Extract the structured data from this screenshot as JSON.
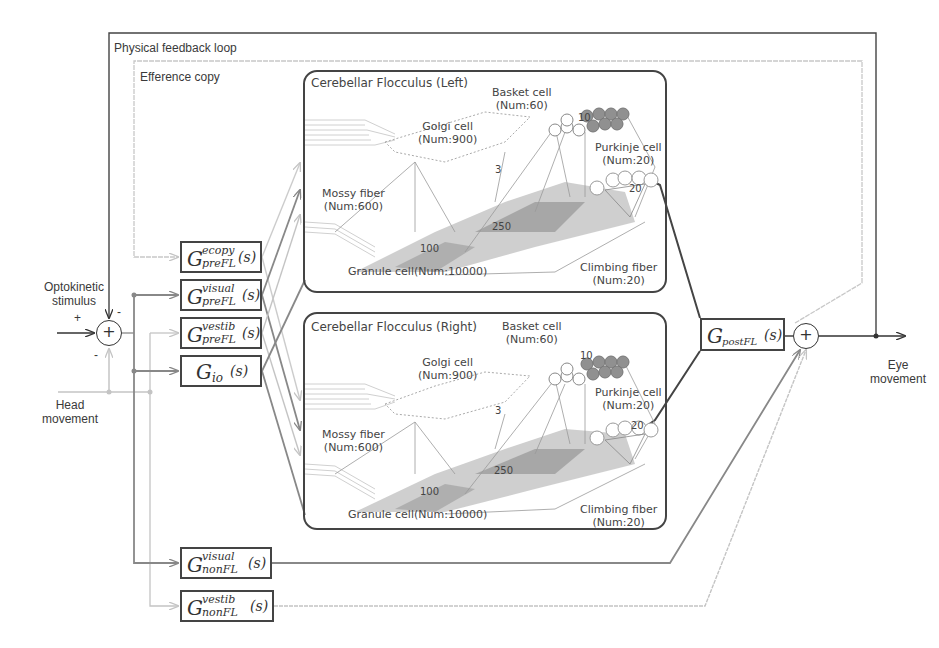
{
  "diagram": {
    "loops": {
      "physical_feedback": "Physical feedback loop",
      "efference_copy": "Efference copy"
    },
    "inputs": {
      "optokinetic": "Optokinetic\nstimulus",
      "optokinetic_line1": "Optokinetic",
      "optokinetic_line2": "stimulus",
      "head_line1": "Head",
      "head_line2": "movement"
    },
    "output": {
      "eye_line1": "Eye",
      "eye_line2": "movement"
    },
    "signs": {
      "plus_in": "+",
      "minus_top": "-",
      "minus_bottom": "-",
      "sum_symbol": "+"
    },
    "blocks": {
      "pre_ecopy": {
        "G": "G",
        "sup": "ecopy",
        "sub": "preFL",
        "arg": "(s)"
      },
      "pre_visual": {
        "G": "G",
        "sup": "visual",
        "sub": "preFL",
        "arg": "(s)"
      },
      "pre_vestib": {
        "G": "G",
        "sup": "vestib",
        "sub": "preFL",
        "arg": "(s)"
      },
      "io": {
        "G": "G",
        "sub": "io",
        "arg": "(s)"
      },
      "post": {
        "G": "G",
        "sub": "postFL",
        "arg": "(s)"
      },
      "non_visual": {
        "G": "G",
        "sup": "visual",
        "sub": "nonFL",
        "arg": "(s)"
      },
      "non_vestib": {
        "G": "G",
        "sup": "vestib",
        "sub": "nonFL",
        "arg": "(s)"
      }
    },
    "flocculi": [
      {
        "title": "Cerebellar Flocculus (Left)",
        "basket": {
          "name": "Basket cell",
          "num": "(Num:60)"
        },
        "golgi": {
          "name": "Golgi cell",
          "num": "(Num:900)"
        },
        "purkinje": {
          "name": "Purkinje cell",
          "num": "(Num:20)"
        },
        "mossy": {
          "name": "Mossy fiber",
          "num": "(Num:600)"
        },
        "granule": {
          "label": "Granule cell(Num:10000)"
        },
        "climbing": {
          "name": "Climbing fiber",
          "num": "(Num:20)"
        },
        "connections": {
          "c10": "10",
          "c3": "3",
          "c20": "20",
          "c100": "100",
          "c250": "250"
        }
      },
      {
        "title": "Cerebellar Flocculus (Right)",
        "basket": {
          "name": "Basket cell",
          "num": "(Num:60)"
        },
        "golgi": {
          "name": "Golgi cell",
          "num": "(Num:900)"
        },
        "purkinje": {
          "name": "Purkinje cell",
          "num": "(Num:20)"
        },
        "mossy": {
          "name": "Mossy fiber",
          "num": "(Num:600)"
        },
        "granule": {
          "label": "Granule cell(Num:10000)"
        },
        "climbing": {
          "name": "Climbing fiber",
          "num": "(Num:20)"
        },
        "connections": {
          "c10": "10",
          "c3": "3",
          "c20": "20",
          "c100": "100",
          "c250": "250"
        }
      }
    ],
    "colors": {
      "dark_line": "#333333",
      "mid_line": "#888888",
      "light_line": "#c4c4c4",
      "granule_fill": "#9a9a9a",
      "basket_fill": "#8a8a8a"
    }
  }
}
